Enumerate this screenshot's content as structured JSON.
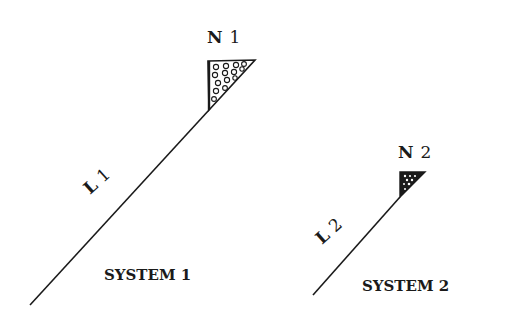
{
  "systems": [
    {
      "title": "SYSTEM 1",
      "node": {
        "label": "N 1",
        "letter": "N",
        "number": "1"
      },
      "line": {
        "label": "L 1",
        "letter": "L",
        "number": "1"
      }
    },
    {
      "title": "SYSTEM 2",
      "node": {
        "label": "N 2",
        "letter": "N",
        "number": "2"
      },
      "line": {
        "label": "L 2",
        "letter": "L",
        "number": "2"
      }
    }
  ],
  "colors": {
    "ink": "#1a1a1a",
    "background": "#ffffff"
  }
}
